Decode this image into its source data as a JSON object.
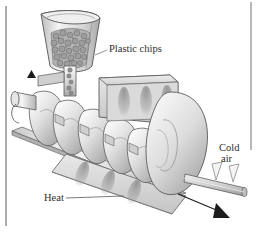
{
  "figure": {
    "kind": "technical-illustration",
    "style": "grayscale line-and-tone drawing",
    "width": 257,
    "height": 241
  },
  "frame": {
    "background_color": "#ffffff",
    "left_rule_color": "#8a8a8a",
    "right_rule_color": "#9a9a9a"
  },
  "labels": {
    "plastic_chips": "Plastic chips",
    "cold_line1": "Cold",
    "cold_line2": "air",
    "heat": "Heat"
  },
  "palette": {
    "outline": "#4a4a4a",
    "outline_soft": "#6e6e6e",
    "metal_light": "#f2f2f2",
    "metal_mid": "#d6d6d6",
    "metal_dark": "#a8a8a8",
    "shade_band": "#8e8e8e",
    "chips": "#9d9d9d",
    "chips_dark": "#6b6b6b",
    "arrow_black": "#1c1c1c",
    "arrow_white": "#f4f4f4",
    "text": "#2e2e2e"
  },
  "components": {
    "hopper": "conical feed hopper holding granular plastic chips",
    "throat": "vertical feed throat dropping chips onto the screw",
    "screw": "horizontal helical screw auger with six flights",
    "barrel_top": "upper heater block with dark heating bands",
    "barrel_bottom": "lower heater block with dark heating bands",
    "die_head": "rounded die head at the discharge end",
    "extrudate": "cylindrical extruded rod leaving the die",
    "rail": "support rail beneath the screw"
  },
  "arrows": {
    "rotation": {
      "name": "screw-rotation-arrow",
      "fill": "#1c1c1c",
      "direction": "up"
    },
    "cold_air": [
      {
        "name": "cold-air-arrow-1",
        "fill": "#f4f4f4",
        "direction": "down-left"
      },
      {
        "name": "cold-air-arrow-2",
        "fill": "#f4f4f4",
        "direction": "down-left"
      }
    ],
    "output": {
      "name": "extrudate-direction-arrow",
      "fill": "#1c1c1c",
      "direction": "down-right"
    }
  },
  "leader_lines": {
    "plastic_chips": "from label left edge down-left to the hopper rim",
    "heat": "from label right edge up-right to the lower heater block"
  }
}
